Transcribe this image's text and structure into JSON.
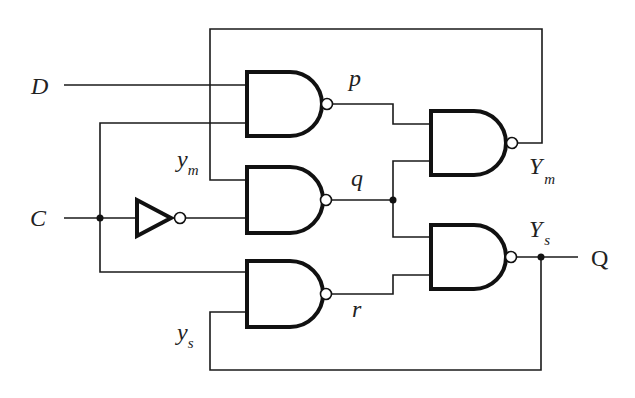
{
  "diagram": {
    "type": "logic-circuit",
    "colors": {
      "ink": "#111111",
      "background": "#ffffff"
    },
    "inputs": {
      "D": {
        "label": "D"
      },
      "C": {
        "label": "C"
      }
    },
    "output": {
      "label": "Q"
    },
    "signals": {
      "p": {
        "label": "p"
      },
      "q": {
        "label": "q"
      },
      "r": {
        "label": "r"
      },
      "ym": {
        "base": "y",
        "sub": "m"
      },
      "ys": {
        "base": "y",
        "sub": "s"
      },
      "Ym": {
        "base": "Y",
        "sub": "m"
      },
      "Ys": {
        "base": "Y",
        "sub": "s"
      }
    },
    "gates": [
      {
        "id": "nand-p",
        "type": "NAND",
        "inputs": [
          "D",
          "C"
        ],
        "output": "p"
      },
      {
        "id": "nand-q",
        "type": "NAND",
        "inputs": [
          "ym",
          "C'"
        ],
        "output": "q"
      },
      {
        "id": "nand-r",
        "type": "NAND",
        "inputs": [
          "C",
          "ys"
        ],
        "output": "r"
      },
      {
        "id": "nand-Ym",
        "type": "NAND",
        "inputs": [
          "p",
          "q"
        ],
        "output": "Ym"
      },
      {
        "id": "nand-Ys",
        "type": "NAND",
        "inputs": [
          "q",
          "r"
        ],
        "output": "Ys"
      },
      {
        "id": "inverter-c",
        "type": "NOT",
        "inputs": [
          "C"
        ],
        "output": "C'"
      }
    ]
  }
}
